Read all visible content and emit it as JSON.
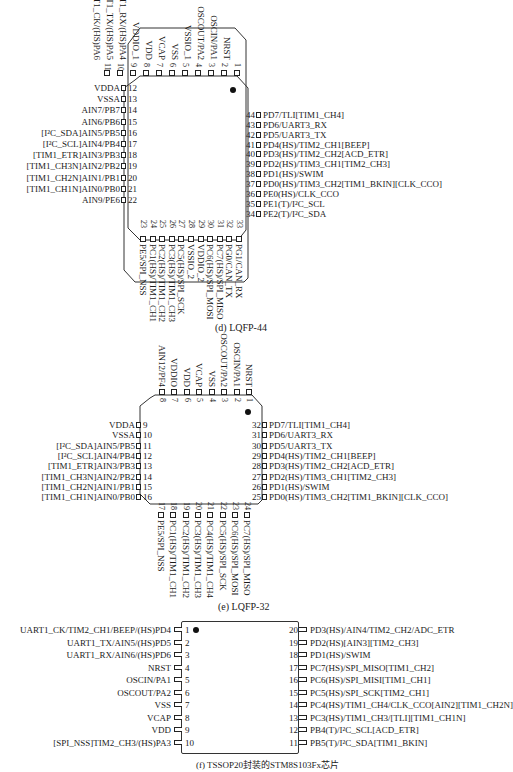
{
  "lqfp44": {
    "caption": "(d)  LQFP-44",
    "top_pins": [
      {
        "num": "1",
        "label": "NRST"
      },
      {
        "num": "2",
        "label": "OSCIN/PA1"
      },
      {
        "num": "3",
        "label": "OSCOUT/PA2"
      },
      {
        "num": "4",
        "label": "VSSIO_1"
      },
      {
        "num": "5",
        "label": "VSS"
      },
      {
        "num": "6",
        "label": "VCAP"
      },
      {
        "num": "7",
        "label": "VDD"
      },
      {
        "num": "8",
        "label": "VDDIO_1"
      },
      {
        "num": "9",
        "label": "UART1_RX/(HS)PA4"
      },
      {
        "num": "10",
        "label": "UART1_TX/(HS)PA5"
      },
      {
        "num": "11",
        "label": "UART1_CK/(HS)PA6"
      }
    ],
    "left_pins": [
      {
        "num": "12",
        "label": "VDDA"
      },
      {
        "num": "13",
        "label": "VSSA"
      },
      {
        "num": "14",
        "label": "AIN7/PB7"
      },
      {
        "num": "15",
        "label": "AIN6/PB6"
      },
      {
        "num": "16",
        "label": "[I²C_SDA]AIN5/PB5"
      },
      {
        "num": "17",
        "label": "[I²C_SCL]AIN4/PB4"
      },
      {
        "num": "18",
        "label": "[TIM1_ETR]AIN3/PB3"
      },
      {
        "num": "19",
        "label": "[TIM1_CH3N]AIN2/PB2"
      },
      {
        "num": "20",
        "label": "[TIM1_CH2N]AIN1/PB1"
      },
      {
        "num": "21",
        "label": "[TIM1_CH1N]AIN0/PB0"
      },
      {
        "num": "22",
        "label": "AIN9/PE6"
      }
    ],
    "bottom_pins": [
      {
        "num": "23",
        "label": "PE5/SPI_NSS"
      },
      {
        "num": "24",
        "label": "PC1(HS)/TIM1_CH1"
      },
      {
        "num": "25",
        "label": "PC2(HS)/TIM1_CH2"
      },
      {
        "num": "26",
        "label": "PC3(HS)/TIM1_CH3"
      },
      {
        "num": "27",
        "label": "PC5(HS)/SPI_SCK"
      },
      {
        "num": "28",
        "label": "VSSIO_2"
      },
      {
        "num": "29",
        "label": "VDDIO_2"
      },
      {
        "num": "30",
        "label": "PC6(HS)/SPI_MOSI"
      },
      {
        "num": "31",
        "label": "PC7(HS)/SPI_MISO"
      },
      {
        "num": "32",
        "label": "PG0/CAN_TX"
      },
      {
        "num": "33",
        "label": "PG1/CAN_RX"
      }
    ],
    "right_pins": [
      {
        "num": "44",
        "label": "PD7/TLI[TIM1_CH4]"
      },
      {
        "num": "43",
        "label": "PD6/UART3_RX"
      },
      {
        "num": "42",
        "label": "PD5/UART3_TX"
      },
      {
        "num": "41",
        "label": "PD4(HS)/TIM2_CH1[BEEP]"
      },
      {
        "num": "40",
        "label": "PD3(HS)/TIM2_CH2[ACD_ETR]"
      },
      {
        "num": "39",
        "label": "PD2(HS)/TIM3_CH1[TIM2_CH3]"
      },
      {
        "num": "38",
        "label": "PD1(HS)/SWIM"
      },
      {
        "num": "37",
        "label": "PD0(HS)/TIM3_CH2[TIM1_BKIN][CLK_CCO]"
      },
      {
        "num": "36",
        "label": "PE0(HS)/CLK_CCO"
      },
      {
        "num": "35",
        "label": "PE1(T)/I²C_SCL"
      },
      {
        "num": "34",
        "label": "PE2(T)/I²C_SDA"
      }
    ]
  },
  "lqfp32": {
    "caption": "(e)  LQFP-32",
    "top_pins": [
      {
        "num": "1",
        "label": "NRST"
      },
      {
        "num": "2",
        "label": "OSCIN/PA1"
      },
      {
        "num": "3",
        "label": "OSCOUT/PA2"
      },
      {
        "num": "4",
        "label": "VSS"
      },
      {
        "num": "5",
        "label": "VCAP"
      },
      {
        "num": "6",
        "label": "VDD"
      },
      {
        "num": "7",
        "label": "VDDIO"
      },
      {
        "num": "8",
        "label": "AIN12/PF4"
      }
    ],
    "left_pins": [
      {
        "num": "9",
        "label": "VDDA"
      },
      {
        "num": "10",
        "label": "VSSA"
      },
      {
        "num": "11",
        "label": "[I²C_SDA]AIN5/PB5"
      },
      {
        "num": "12",
        "label": "[I²C_SCL]AIN4/PB4"
      },
      {
        "num": "13",
        "label": "[TIM1_ETR]AIN3/PB3"
      },
      {
        "num": "14",
        "label": "[TIM1_CH3N]AIN2/PB2"
      },
      {
        "num": "15",
        "label": "[TIM1_CH2N]AIN1/PB1"
      },
      {
        "num": "16",
        "label": "[TIM1_CH1N]AIN0/PB0"
      }
    ],
    "bottom_pins": [
      {
        "num": "17",
        "label": "PE5/SPI_NSS"
      },
      {
        "num": "18",
        "label": "PC1(HS)/TIM1_CH1"
      },
      {
        "num": "19",
        "label": "PC2(HS)/TIM1_CH2"
      },
      {
        "num": "20",
        "label": "PC3(HS)/TIM1_CH3"
      },
      {
        "num": "21",
        "label": "PC4(HS)/TIM1_CH4"
      },
      {
        "num": "22",
        "label": "PC5(HS)/SPI_SCK"
      },
      {
        "num": "23",
        "label": "PC6(HS)/SPI_MOSI"
      },
      {
        "num": "24",
        "label": "PC7(HS)/SPI_MISO"
      }
    ],
    "right_pins": [
      {
        "num": "32",
        "label": "PD7/TLI[TIM1_CH4]"
      },
      {
        "num": "31",
        "label": "PD6/UART3_RX"
      },
      {
        "num": "30",
        "label": "PD5/UART3_TX"
      },
      {
        "num": "29",
        "label": "PD4(HS)/TIM2_CH1[BEEP]"
      },
      {
        "num": "28",
        "label": "PD3(HS)/TIM2_CH2[ACD_ETR]"
      },
      {
        "num": "27",
        "label": "PD2(HS)/TIM3_CH1[TIM2_CH3]"
      },
      {
        "num": "26",
        "label": "PD1(HS)/SWIM"
      },
      {
        "num": "25",
        "label": "PD0(HS)/TIM3_CH2[TIM1_BKIN][CLK_CCO]"
      }
    ]
  },
  "tssop20": {
    "caption": "(f)  TSSOP20封装的STM8S103Fx芯片",
    "left_pins": [
      {
        "num": "1",
        "label": "UART1_CK/TIM2_CH1/BEEP/(HS)PD4"
      },
      {
        "num": "2",
        "label": "UART1_TX/AIN5/(HS)PD5"
      },
      {
        "num": "3",
        "label": "UART1_RX/AIN6/(HS)PD6"
      },
      {
        "num": "4",
        "label": "NRST"
      },
      {
        "num": "5",
        "label": "OSCIN/PA1"
      },
      {
        "num": "6",
        "label": "OSCOUT/PA2"
      },
      {
        "num": "7",
        "label": "VSS"
      },
      {
        "num": "8",
        "label": "VCAP"
      },
      {
        "num": "9",
        "label": "VDD"
      },
      {
        "num": "10",
        "label": "[SPI_NSS]TIM2_CH3/(HS)PA3"
      }
    ],
    "right_pins": [
      {
        "num": "20",
        "label": "PD3(HS)/AIN4/TIM2_CH2/ADC_ETR"
      },
      {
        "num": "19",
        "label": "PD2(HS)[AIN3][TIM2_CH3]"
      },
      {
        "num": "18",
        "label": "PD1(HS)/SWIM"
      },
      {
        "num": "17",
        "label": "PC7(HS)/SPI_MISO[TIM1_CH2]"
      },
      {
        "num": "16",
        "label": "PC6(HS)/SPI_MISI[TIM1_CH1]"
      },
      {
        "num": "15",
        "label": "PC5(HS)/SPI_SCK[TIM2_CH1]"
      },
      {
        "num": "14",
        "label": "PC4(HS)/TIM1_CH4/CLK_CCO[AIN2][TIM1_CH2N]"
      },
      {
        "num": "13",
        "label": "PC3(HS)/TIM1_CH3/[TLI][TIM1_CH1N]"
      },
      {
        "num": "12",
        "label": "PB4(T)/I²C_SCL[ACD_ETR]"
      },
      {
        "num": "11",
        "label": "PB5(T)/I²C_SDA[TIM1_BKIN]"
      }
    ]
  }
}
